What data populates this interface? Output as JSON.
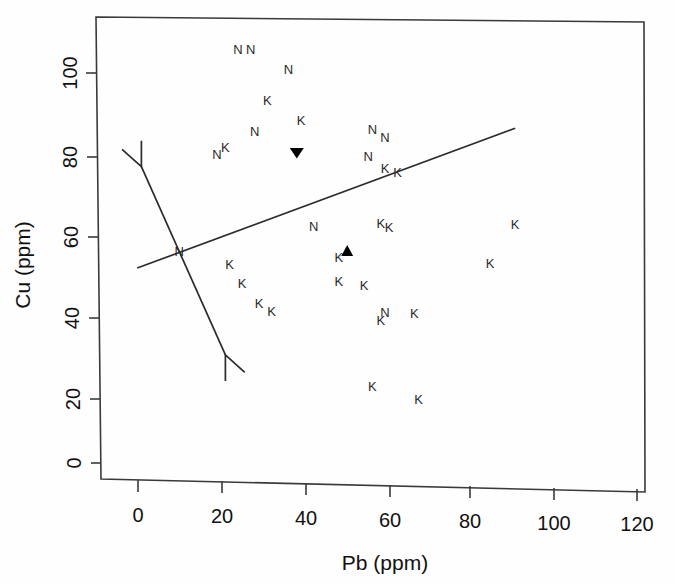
{
  "chart_data": {
    "type": "scatter",
    "title": "",
    "xlabel": "Pb (ppm)",
    "ylabel": "Cu (ppm)",
    "xlim": [
      -8,
      128
    ],
    "ylim": [
      -3,
      116
    ],
    "xticks": [
      0,
      20,
      40,
      60,
      80,
      100,
      120
    ],
    "yticks": [
      0,
      20,
      40,
      60,
      80,
      100
    ],
    "grid": false,
    "legend": "none",
    "series": [
      {
        "name": "N",
        "marker_label": "N",
        "points": [
          {
            "x": 25,
            "y": 106
          },
          {
            "x": 28,
            "y": 106
          },
          {
            "x": 37,
            "y": 101
          },
          {
            "x": 29,
            "y": 85
          },
          {
            "x": 20,
            "y": 79
          },
          {
            "x": 57,
            "y": 86
          },
          {
            "x": 60,
            "y": 84
          },
          {
            "x": 56,
            "y": 79
          },
          {
            "x": 43,
            "y": 61
          },
          {
            "x": 11,
            "y": 54
          },
          {
            "x": 60,
            "y": 39
          }
        ]
      },
      {
        "name": "K",
        "marker_label": "K",
        "points": [
          {
            "x": 32,
            "y": 93
          },
          {
            "x": 40,
            "y": 88
          },
          {
            "x": 22,
            "y": 81
          },
          {
            "x": 60,
            "y": 76
          },
          {
            "x": 63,
            "y": 75
          },
          {
            "x": 59,
            "y": 62
          },
          {
            "x": 61,
            "y": 61
          },
          {
            "x": 49,
            "y": 53
          },
          {
            "x": 23,
            "y": 51
          },
          {
            "x": 26,
            "y": 46
          },
          {
            "x": 49,
            "y": 47
          },
          {
            "x": 55,
            "y": 46
          },
          {
            "x": 30,
            "y": 41
          },
          {
            "x": 33,
            "y": 39
          },
          {
            "x": 59,
            "y": 37
          },
          {
            "x": 67,
            "y": 39
          },
          {
            "x": 57,
            "y": 20
          },
          {
            "x": 68,
            "y": 17
          },
          {
            "x": 91,
            "y": 62
          },
          {
            "x": 85,
            "y": 52
          }
        ]
      },
      {
        "name": "group-centroid-down",
        "marker_label": "triangle-down",
        "points": [
          {
            "x": 39,
            "y": 80
          }
        ]
      },
      {
        "name": "group-centroid-up",
        "marker_label": "triangle-up",
        "points": [
          {
            "x": 51,
            "y": 55
          }
        ]
      }
    ],
    "annotations": [
      {
        "name": "regression-line",
        "type": "line",
        "x1": 1,
        "y1": 50,
        "x2": 91,
        "y2": 87
      },
      {
        "name": "double-headed-vector",
        "type": "double-arrow",
        "x1": 2,
        "y1": 76,
        "x2": 22,
        "y2": 28
      }
    ]
  },
  "axes": {
    "x_title": "Pb (ppm)",
    "y_title": "Cu (ppm)",
    "x_tick_labels": [
      "0",
      "20",
      "40",
      "60",
      "80",
      "100",
      "120"
    ],
    "y_tick_labels": [
      "0",
      "20",
      "40",
      "60",
      "80",
      "100"
    ]
  },
  "colors": {
    "background": "#fefefe",
    "axis": "#3a3a3a",
    "text": "#111111",
    "point": "#2a2a2a",
    "marker_fill": "#000000"
  }
}
